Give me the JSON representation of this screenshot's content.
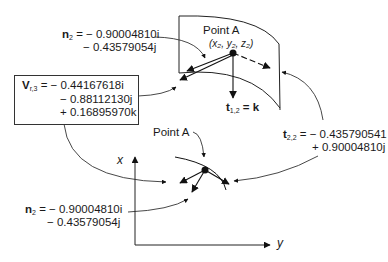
{
  "diagram": {
    "top": {
      "n2": {
        "symbol": "n",
        "subscript": "2",
        "line1": "= − 0.90004810i",
        "line2": "− 0.43579054j"
      },
      "point_a": {
        "label": "Point A",
        "coords": "(x₂, y₂, z₂)"
      },
      "t12": {
        "symbol": "t",
        "subscript": "1,2",
        "rest": "= k"
      }
    },
    "v_box": {
      "symbol": "V",
      "subscript": "r,3",
      "line1": "= − 0.44167618i",
      "line2": "− 0.88112130j",
      "line3": "+ 0.16895970k"
    },
    "t22": {
      "symbol": "t",
      "subscript": "2,2",
      "line1": "= − 0.435790541",
      "line2": "+ 0.90004810j"
    },
    "bottom": {
      "point_a_label": "Point A",
      "n2": {
        "symbol": "n",
        "subscript": "2",
        "line1": "= − 0.90004810i",
        "line2": "− 0.43579054j"
      },
      "x_axis_label": "x",
      "y_axis_label": "y"
    }
  }
}
